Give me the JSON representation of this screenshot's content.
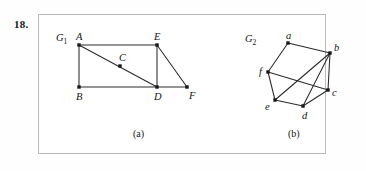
{
  "problem": {
    "number": "18."
  },
  "figure": {
    "frame": {
      "x": 38,
      "y": 14,
      "width": 288,
      "height": 140
    },
    "captions": [
      {
        "id": "caption-a",
        "text": "(a)",
        "x": 133,
        "y": 128
      },
      {
        "id": "caption-b",
        "text": "(b)",
        "x": 288,
        "y": 128
      }
    ]
  },
  "graphs": [
    {
      "id": "graph-a",
      "name": "G1",
      "name_base": "G",
      "name_sub": "1",
      "name_label_pos": {
        "x": 56,
        "y": 33
      },
      "vertices": [
        {
          "id": "A",
          "label": "A",
          "x": 79,
          "y": 45,
          "label_dx": -3,
          "label_dy": -13
        },
        {
          "id": "B",
          "label": "B",
          "x": 79,
          "y": 87,
          "label_dx": -3,
          "label_dy": 5
        },
        {
          "id": "C",
          "label": "C",
          "x": 120,
          "y": 66,
          "label_dx": -1,
          "label_dy": -13
        },
        {
          "id": "D",
          "label": "D",
          "x": 157,
          "y": 87,
          "label_dx": -3,
          "label_dy": 5
        },
        {
          "id": "E",
          "label": "E",
          "x": 157,
          "y": 45,
          "label_dx": -3,
          "label_dy": -13
        },
        {
          "id": "F",
          "label": "F",
          "x": 187,
          "y": 87,
          "label_dx": 2,
          "label_dy": 4
        }
      ],
      "edges": [
        [
          "A",
          "E"
        ],
        [
          "A",
          "B"
        ],
        [
          "A",
          "D"
        ],
        [
          "B",
          "D"
        ],
        [
          "E",
          "D"
        ],
        [
          "E",
          "F"
        ],
        [
          "D",
          "F"
        ]
      ]
    },
    {
      "id": "graph-b",
      "name": "G2",
      "name_base": "G",
      "name_sub": "2",
      "name_label_pos": {
        "x": 245,
        "y": 34
      },
      "vertices": [
        {
          "id": "a",
          "label": "a",
          "x": 288,
          "y": 43,
          "label_dx": -2,
          "label_dy": -12
        },
        {
          "id": "b",
          "label": "b",
          "x": 330,
          "y": 53,
          "label_dx": 4,
          "label_dy": -10
        },
        {
          "id": "c",
          "label": "c",
          "x": 328,
          "y": 90,
          "label_dx": 4,
          "label_dy": -2
        },
        {
          "id": "d",
          "label": "d",
          "x": 303,
          "y": 106,
          "label_dx": -1,
          "label_dy": 5
        },
        {
          "id": "e",
          "label": "e",
          "x": 275,
          "y": 100,
          "label_dx": -10,
          "label_dy": 2
        },
        {
          "id": "f",
          "label": "f",
          "x": 268,
          "y": 72,
          "label_dx": -9,
          "label_dy": -5
        }
      ],
      "edges": [
        [
          "a",
          "b"
        ],
        [
          "a",
          "f"
        ],
        [
          "f",
          "e"
        ],
        [
          "f",
          "c"
        ],
        [
          "e",
          "d"
        ],
        [
          "e",
          "b"
        ],
        [
          "d",
          "c"
        ],
        [
          "d",
          "b"
        ],
        [
          "b",
          "c"
        ]
      ]
    }
  ],
  "style": {
    "edge_color": "#2a2a2a",
    "node_color": "#181818",
    "frame_color": "#b9b9b9",
    "text_color": "#141414",
    "background": "#ffffff"
  }
}
